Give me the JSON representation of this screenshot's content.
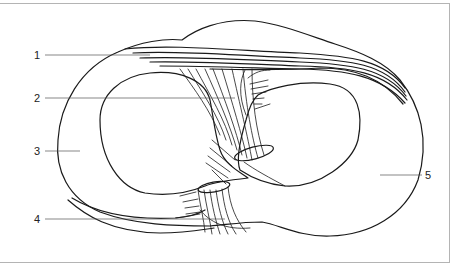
{
  "figure": {
    "type": "anatomical line drawing",
    "colors": {
      "stroke": "#1a1a1a",
      "leader": "#555555",
      "frame": "#b4b4b4",
      "background": "#ffffff"
    }
  },
  "labels": [
    {
      "id": "1",
      "text": "1",
      "side": "left"
    },
    {
      "id": "2",
      "text": "2",
      "side": "left"
    },
    {
      "id": "3",
      "text": "3",
      "side": "left"
    },
    {
      "id": "4",
      "text": "4",
      "side": "left"
    },
    {
      "id": "5",
      "text": "5",
      "side": "right"
    }
  ]
}
